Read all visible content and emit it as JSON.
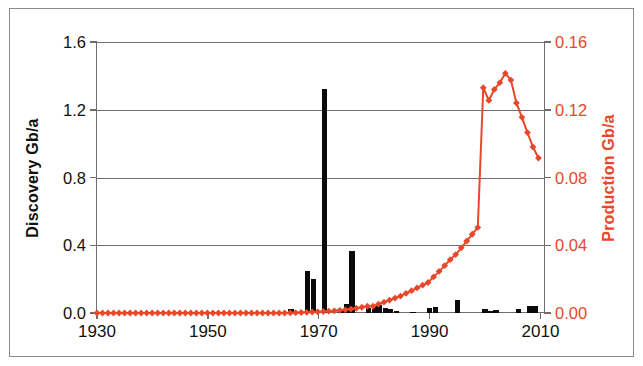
{
  "chart_data": {
    "type": "bar",
    "title": "",
    "subtitle": "",
    "xlabel": "",
    "ylabel": "Discovery Gb/a",
    "y2label": "Production Gb/a",
    "xlim": [
      1930,
      2011
    ],
    "ylim": [
      0.0,
      1.6
    ],
    "y2lim": [
      0.0,
      0.16
    ],
    "grid": true,
    "legend": "none",
    "colors": {
      "discovery_bars": "#0a0a0a",
      "production_line": "#E8472A",
      "axis": "#6e6e6e",
      "frame": "#8a8a8a",
      "background": "#ffffff"
    },
    "x_ticks": [
      1930,
      1950,
      1970,
      1990,
      2010
    ],
    "x_tick_labels": [
      "1930",
      "1950",
      "1970",
      "1990",
      "2010"
    ],
    "y_ticks": [
      0.0,
      0.4,
      0.8,
      1.2,
      1.6
    ],
    "y_tick_labels": [
      "0.0",
      "0.4",
      "0.8",
      "1.2",
      "1.6"
    ],
    "y2_ticks": [
      0.0,
      0.04,
      0.08,
      0.12,
      0.16
    ],
    "y2_tick_labels": [
      "0.00",
      "0.04",
      "0.08",
      "0.12",
      "0.16"
    ],
    "series": [
      {
        "name": "Discovery Gb/a",
        "type": "bar",
        "axis": "left",
        "color": "#0a0a0a",
        "x": [
          1930,
          1931,
          1932,
          1933,
          1934,
          1935,
          1936,
          1937,
          1938,
          1939,
          1940,
          1941,
          1942,
          1943,
          1944,
          1945,
          1946,
          1947,
          1948,
          1949,
          1950,
          1951,
          1952,
          1953,
          1954,
          1955,
          1956,
          1957,
          1958,
          1959,
          1960,
          1961,
          1962,
          1963,
          1964,
          1965,
          1966,
          1967,
          1968,
          1969,
          1970,
          1971,
          1972,
          1973,
          1974,
          1975,
          1976,
          1977,
          1978,
          1979,
          1980,
          1981,
          1982,
          1983,
          1984,
          1985,
          1986,
          1987,
          1988,
          1989,
          1990,
          1991,
          1992,
          1993,
          1994,
          1995,
          1996,
          1997,
          1998,
          1999,
          2000,
          2001,
          2002,
          2003,
          2004,
          2005,
          2006,
          2007,
          2008,
          2009,
          2010
        ],
        "values": [
          0.0,
          0.0,
          0.0,
          0.0,
          0.0,
          0.0,
          0.0,
          0.0,
          0.0,
          0.0,
          0.0,
          0.0,
          0.0,
          0.0,
          0.0,
          0.0,
          0.0,
          0.0,
          0.0,
          0.0,
          0.0,
          0.0,
          0.0,
          0.0,
          0.0,
          0.0,
          0.0,
          0.0,
          0.0,
          0.0,
          0.0,
          0.0,
          0.0,
          0.0,
          0.0,
          0.022,
          0.0,
          0.0,
          0.25,
          0.2,
          0.0,
          1.32,
          0.0,
          0.0,
          0.025,
          0.055,
          0.365,
          0.0,
          0.0,
          0.03,
          0.04,
          0.045,
          0.03,
          0.022,
          0.01,
          0.0,
          0.0,
          0.005,
          0.0,
          0.0,
          0.028,
          0.035,
          0.0,
          0.0,
          0.0,
          0.075,
          0.0,
          0.0,
          0.0,
          0.0,
          0.022,
          0.01,
          0.018,
          0.0,
          0.0,
          0.0,
          0.022,
          0.0,
          0.042,
          0.042,
          0.0
        ]
      },
      {
        "name": "Production Gb/a",
        "type": "line",
        "axis": "right",
        "color": "#E8472A",
        "marker": "diamond",
        "x": [
          1930,
          1931,
          1932,
          1933,
          1934,
          1935,
          1936,
          1937,
          1938,
          1939,
          1940,
          1941,
          1942,
          1943,
          1944,
          1945,
          1946,
          1947,
          1948,
          1949,
          1950,
          1951,
          1952,
          1953,
          1954,
          1955,
          1956,
          1957,
          1958,
          1959,
          1960,
          1961,
          1962,
          1963,
          1964,
          1965,
          1966,
          1967,
          1968,
          1969,
          1970,
          1971,
          1972,
          1973,
          1974,
          1975,
          1976,
          1977,
          1978,
          1979,
          1980,
          1981,
          1982,
          1983,
          1984,
          1985,
          1986,
          1987,
          1988,
          1989,
          1990,
          1991,
          1992,
          1993,
          1994,
          1995,
          1996,
          1997,
          1998,
          1999,
          2000,
          2001,
          2002,
          2003,
          2004,
          2005,
          2006,
          2007,
          2008,
          2009,
          2010
        ],
        "values": [
          0.0,
          0.0,
          0.0,
          0.0,
          0.0,
          0.0,
          0.0,
          0.0,
          0.0,
          0.0,
          0.0,
          0.0,
          0.0,
          0.0,
          0.0,
          0.0,
          0.0,
          0.0,
          0.0,
          0.0,
          0.0,
          0.0,
          0.0,
          0.0,
          0.0,
          0.0,
          0.0,
          0.0,
          0.0,
          0.0,
          0.0,
          0.0,
          0.0,
          0.0,
          0.0,
          0.0001,
          0.0002,
          0.0003,
          0.0004,
          0.0006,
          0.0007,
          0.0009,
          0.0011,
          0.0013,
          0.0016,
          0.0019,
          0.0023,
          0.0028,
          0.0034,
          0.004,
          0.0036,
          0.0041,
          0.005,
          0.006,
          0.0072,
          0.0086,
          0.01,
          0.0118,
          0.0135,
          0.0155,
          0.018,
          0.021,
          0.0245,
          0.028,
          0.0315,
          0.0345,
          0.0375,
          0.0405,
          0.0455,
          0.0505,
          0.0555,
          0.06,
          0.0625,
          0.0645,
          0.066,
          0.068,
          0.07,
          0.079,
          0.086,
          0.088,
          0.096
        ]
      }
    ],
    "production_secondary": {
      "note": "values above are a compatible rescaling; canonical read-off of the red curve on the right axis",
      "x": [
        1980,
        1985,
        1990,
        1995,
        1999,
        2000,
        2001,
        2002,
        2003,
        2004,
        2005,
        2006,
        2007,
        2008,
        2009,
        2010
      ],
      "values": [
        0.004,
        0.01,
        0.018,
        0.0345,
        0.0505,
        0.133,
        0.1255,
        0.132,
        0.136,
        0.1415,
        0.1375,
        0.124,
        0.1155,
        0.1065,
        0.098,
        0.0915
      ]
    }
  }
}
